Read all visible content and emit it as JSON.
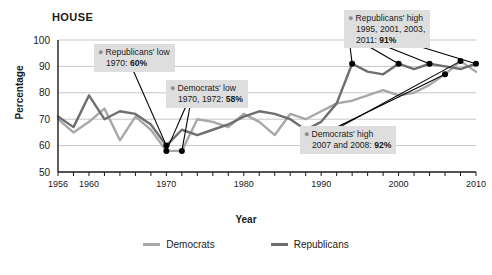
{
  "chart_data": {
    "type": "line",
    "title": "HOUSE",
    "xlabel": "Year",
    "ylabel": "Percentage",
    "ylim": [
      50,
      100
    ],
    "yticks": [
      50,
      60,
      70,
      80,
      90,
      100
    ],
    "xlim": [
      1956,
      2010
    ],
    "xticks_labeled": [
      1956,
      1960,
      1970,
      1980,
      1990,
      2000,
      2010
    ],
    "xtick_interval": 2,
    "grid": true,
    "legend_position": "bottom",
    "x": [
      1956,
      1958,
      1960,
      1962,
      1964,
      1966,
      1968,
      1970,
      1972,
      1974,
      1976,
      1978,
      1980,
      1982,
      1984,
      1986,
      1988,
      1990,
      1992,
      1994,
      1996,
      1998,
      2000,
      2002,
      2004,
      2006,
      2008,
      2010
    ],
    "series": [
      {
        "name": "Democrats",
        "color": "#a8a8a8",
        "values": [
          70,
          65,
          69,
          74,
          62,
          71,
          66,
          58,
          58,
          70,
          69,
          67,
          72,
          69,
          64,
          72,
          70,
          73,
          76,
          77,
          79,
          81,
          79,
          80,
          83,
          87,
          92,
          88
        ]
      },
      {
        "name": "Republicans",
        "color": "#6e6e6e",
        "values": [
          71,
          67,
          79,
          70,
          73,
          72,
          68,
          60,
          66,
          64,
          66,
          68,
          71,
          73,
          72,
          70,
          66,
          69,
          76,
          91,
          88,
          87,
          91,
          89,
          91,
          90,
          89,
          91
        ]
      }
    ],
    "annotations": [
      {
        "id": "republicans-low",
        "line1": "Republicans' low",
        "line2": "1970: ",
        "value": "60%",
        "points": [
          {
            "year": 1970,
            "pct": 60
          }
        ]
      },
      {
        "id": "democrats-low",
        "line1": "Democrats' low",
        "line2": "1970, 1972: ",
        "value": "58%",
        "points": [
          {
            "year": 1970,
            "pct": 58
          },
          {
            "year": 1972,
            "pct": 58
          }
        ]
      },
      {
        "id": "republicans-high",
        "line1": "Republicans' high",
        "line2": "1995, 2001, 2003,",
        "line3": "2011: ",
        "value": "91%",
        "points": [
          {
            "year": 1994,
            "pct": 91
          },
          {
            "year": 2000,
            "pct": 91
          },
          {
            "year": 2004,
            "pct": 91
          },
          {
            "year": 2010,
            "pct": 91
          }
        ]
      },
      {
        "id": "democrats-high",
        "line1": "Democrats' high",
        "line2": "2007 and 2008: ",
        "value": "92%",
        "points": [
          {
            "year": 2006,
            "pct": 87
          },
          {
            "year": 2008,
            "pct": 92
          }
        ]
      }
    ]
  },
  "legend": {
    "items": [
      {
        "label": "Democrats",
        "color": "#a8a8a8"
      },
      {
        "label": "Republicans",
        "color": "#6e6e6e"
      }
    ]
  },
  "annotation_text": {
    "rep_low_l1": "Republicans' low",
    "rep_low_l2": "1970: ",
    "rep_low_val": "60%",
    "dem_low_l1": "Democrats' low",
    "dem_low_l2": "1970, 1972: ",
    "dem_low_val": "58%",
    "rep_high_l1": "Republicans' high",
    "rep_high_l2": "1995, 2001, 2003,",
    "rep_high_l3": "2011: ",
    "rep_high_val": "91%",
    "dem_high_l1": "Democrats' high",
    "dem_high_l2": "2007 and 2008: ",
    "dem_high_val": "92%"
  }
}
